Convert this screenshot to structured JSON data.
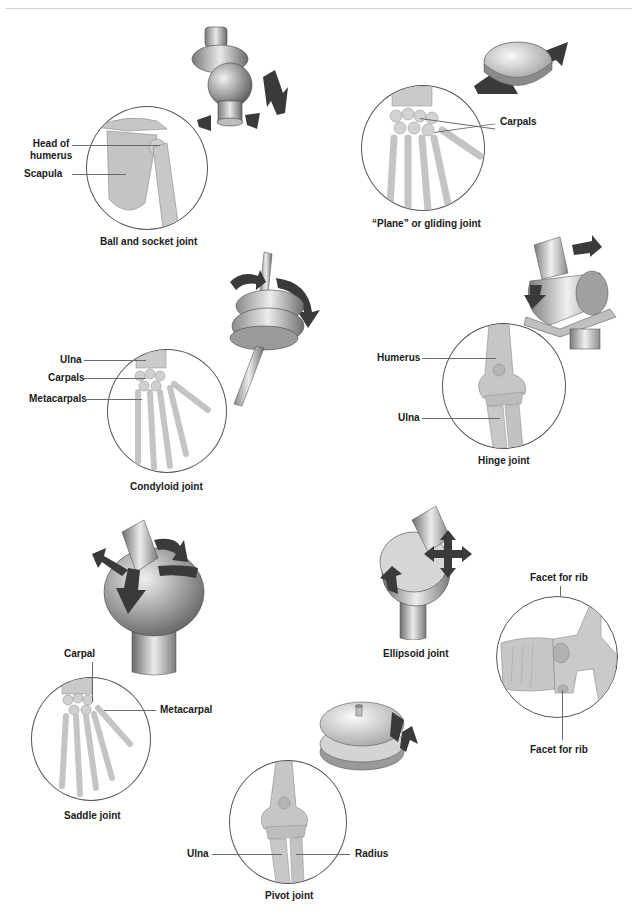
{
  "colors": {
    "background": "#ffffff",
    "bone": "#c9c9c9",
    "bone_shadow": "#9a9a9a",
    "model_light": "#e6e6e6",
    "model_dark": "#6e6e6e",
    "arrow": "#3a3a3a",
    "leader_line": "#6a6a6a",
    "label_text": "#1a1a1a"
  },
  "joints": [
    {
      "id": "ball-and-socket",
      "caption": "Ball and socket joint",
      "labels": [
        "Head of humerus",
        "Scapula"
      ],
      "label_lines": [
        "Head of",
        "humerus"
      ],
      "model_icon": "ball-socket-model-icon",
      "movement": "multi-axial rotation"
    },
    {
      "id": "plane-gliding",
      "caption": "“Plane” or gliding joint",
      "labels": [
        "Carpals"
      ],
      "model_icon": "gliding-disc-model-icon",
      "movement": "sliding"
    },
    {
      "id": "condyloid",
      "caption": "Condyloid joint",
      "labels": [
        "Ulna",
        "Carpals",
        "Metacarpals"
      ],
      "model_icon": "condyloid-model-icon",
      "movement": "biaxial"
    },
    {
      "id": "hinge",
      "caption": "Hinge joint",
      "labels": [
        "Humerus",
        "Ulna"
      ],
      "model_icon": "hinge-cylinder-model-icon",
      "movement": "flexion/extension"
    },
    {
      "id": "saddle",
      "caption": "Saddle joint",
      "labels": [
        "Carpal",
        "Metacarpal"
      ],
      "model_icon": "saddle-model-icon",
      "movement": "biaxial"
    },
    {
      "id": "ellipsoid",
      "caption": "Ellipsoid joint",
      "labels": [
        "Facet for rib",
        "Facet for rib"
      ],
      "model_icon": "ellipsoid-model-icon",
      "movement": "biaxial"
    },
    {
      "id": "pivot",
      "caption": "Pivot joint",
      "labels": [
        "Ulna",
        "Radius"
      ],
      "model_icon": "pivot-model-icon",
      "movement": "rotation"
    }
  ]
}
